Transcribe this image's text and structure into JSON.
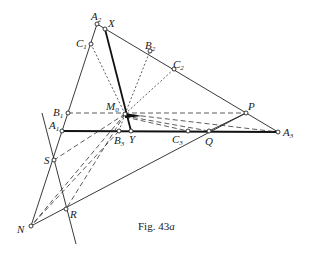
{
  "figure": {
    "caption_prefix": "Fig. 43",
    "caption_suffix": "a"
  },
  "points": {
    "A2": {
      "label": "A",
      "sub": "2",
      "x": 97,
      "y": 24
    },
    "X": {
      "label": "X",
      "sub": "",
      "x": 105,
      "y": 29
    },
    "C1": {
      "label": "C",
      "sub": "1",
      "x": 91,
      "y": 44
    },
    "B2": {
      "label": "B",
      "sub": "2",
      "x": 150,
      "y": 51
    },
    "C2": {
      "label": "C",
      "sub": "2",
      "x": 174,
      "y": 69
    },
    "B1": {
      "label": "B",
      "sub": "1",
      "x": 68,
      "y": 113
    },
    "M0": {
      "label": "M",
      "sub": "0",
      "x": 125,
      "y": 114
    },
    "P": {
      "label": "P",
      "sub": "",
      "x": 246,
      "y": 113
    },
    "A1": {
      "label": "A",
      "sub": "1",
      "x": 62,
      "y": 131
    },
    "B3": {
      "label": "B",
      "sub": "3",
      "x": 119,
      "y": 131
    },
    "Y": {
      "label": "Y",
      "sub": "",
      "x": 131,
      "y": 131
    },
    "C3": {
      "label": "C",
      "sub": "3",
      "x": 188,
      "y": 131
    },
    "Q": {
      "label": "Q",
      "sub": "",
      "x": 209,
      "y": 131
    },
    "A3": {
      "label": "A",
      "sub": "3",
      "x": 278,
      "y": 132
    },
    "S": {
      "label": "S",
      "sub": "",
      "x": 54,
      "y": 160
    },
    "R": {
      "label": "R",
      "sub": "",
      "x": 66,
      "y": 209
    },
    "N": {
      "label": "N",
      "sub": "",
      "x": 31,
      "y": 226
    }
  },
  "labels": {
    "A2": "A",
    "A2_sub": "2",
    "X": "X",
    "C1": "C",
    "C1_sub": "1",
    "B2": "B",
    "B2_sub": "2",
    "C2": "C",
    "C2_sub": "2",
    "B1": "B",
    "B1_sub": "1",
    "M0": "M",
    "M0_sub": "0",
    "P": "P",
    "A1": "A",
    "A1_sub": "1",
    "B3": "B",
    "B3_sub": "3",
    "Y": "Y",
    "C3": "C",
    "C3_sub": "3",
    "Q": "Q",
    "A3": "A",
    "A3_sub": "3",
    "S": "S",
    "R": "R",
    "N": "N"
  },
  "caption": "Fig. 43a"
}
